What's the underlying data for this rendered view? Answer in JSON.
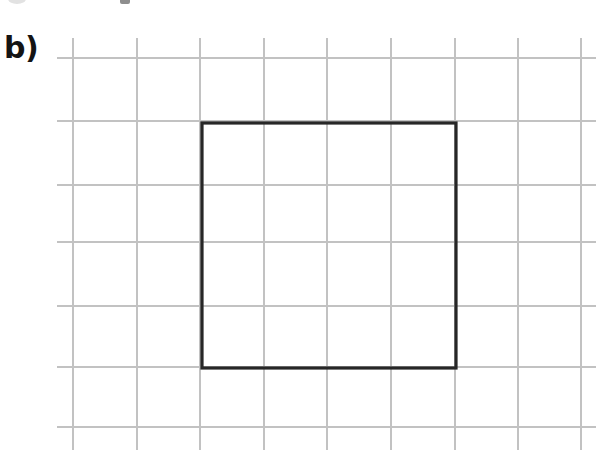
{
  "figure": {
    "panel_label": "b)",
    "caption": "",
    "background_color": "#ffffff",
    "width": 612,
    "height": 464
  },
  "grid": {
    "line_color": "#c2c2c2",
    "line_width": 1.1,
    "cell_size": 63.7,
    "vertical_line_x": [
      73,
      137,
      200,
      264,
      327,
      391,
      455,
      518,
      581
    ],
    "horizontal_line_y": [
      58,
      121,
      185,
      242,
      306,
      367,
      427
    ],
    "horizontal_extent": [
      57,
      596
    ],
    "vertical_extent": [
      38,
      450
    ]
  },
  "chart_data": {
    "type": "scatter",
    "title": "b)",
    "xlabel": "",
    "ylabel": "",
    "grid": true,
    "legend_position": "none",
    "shapes": [
      {
        "name": "square",
        "kind": "rectangle",
        "stroke_color": "#272727",
        "stroke_width": 3.2,
        "fill": "none",
        "x": 202,
        "y": 123,
        "width": 254,
        "height": 245,
        "corners_px": [
          [
            202,
            123
          ],
          [
            456,
            123
          ],
          [
            456,
            368
          ],
          [
            202,
            368
          ]
        ],
        "width_in_cells": 4,
        "height_in_cells": 4
      }
    ]
  },
  "artifacts": {
    "top_left_smudge": "scan-smudge",
    "top_mid_mark": "scan-mark"
  }
}
